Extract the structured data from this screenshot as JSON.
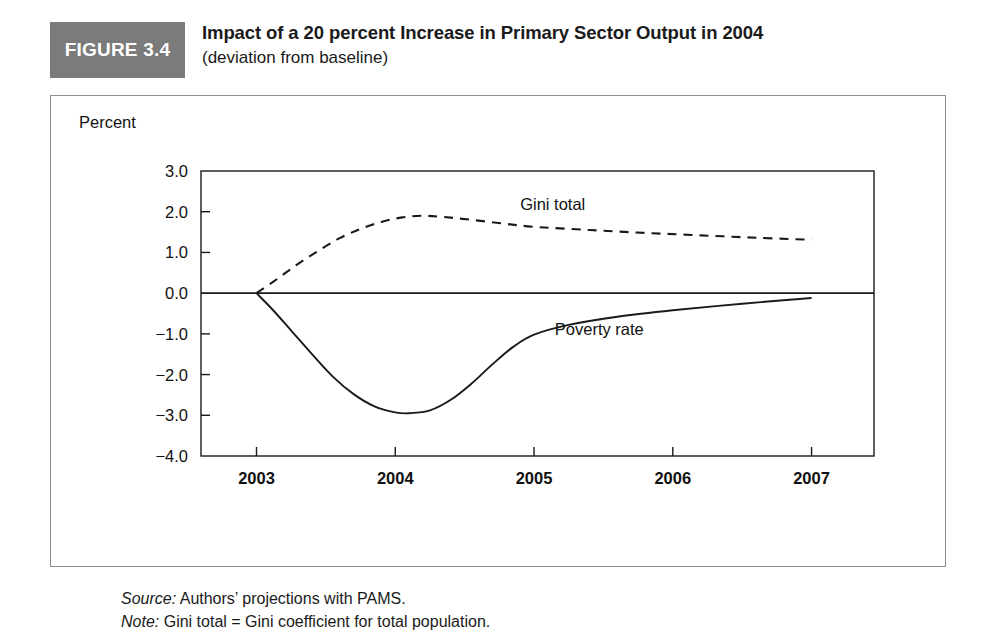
{
  "figure": {
    "tag": "FIGURE 3.4",
    "title": "Impact of a 20 percent Increase in Primary Sector Output in 2004",
    "subtitle": "(deviation from baseline)",
    "tag_bg_color": "#7b7b7b",
    "tag_text_color": "#ffffff",
    "frame_color": "#8d8d8d"
  },
  "footnotes": {
    "source_lead": "Source:",
    "source_text": " Authors’ projections with PAMS.",
    "note_lead": "Note:",
    "note_text": " Gini total = Gini coefficient for total population."
  },
  "chart_data": {
    "type": "line",
    "title": "Impact of a 20 percent Increase in Primary Sector Output in 2004",
    "subtitle": "(deviation from baseline)",
    "xlabel": "",
    "ylabel": "Percent",
    "unit_label": "Percent",
    "grid": false,
    "legend_position": "inline-labels",
    "x": [
      2003,
      2004,
      2005,
      2006,
      2007
    ],
    "xlim": [
      2002.6,
      2007.45
    ],
    "ylim": [
      -4.0,
      3.0
    ],
    "xticks": [
      "2003",
      "2004",
      "2005",
      "2006",
      "2007"
    ],
    "yticks": [
      "3.0",
      "2.0",
      "1.0",
      "0.0",
      "−1.0",
      "−2.0",
      "−3.0",
      "−4.0"
    ],
    "ytick_values": [
      3.0,
      2.0,
      1.0,
      0.0,
      -1.0,
      -2.0,
      -3.0,
      -4.0
    ],
    "zero_line": 0.0,
    "series": [
      {
        "name": "Gini total",
        "style": "dashed",
        "label_x": 2004.9,
        "label_y": 2.05,
        "points": [
          {
            "x": 2003.0,
            "y": 0.0
          },
          {
            "x": 2003.15,
            "y": 0.35
          },
          {
            "x": 2003.3,
            "y": 0.72
          },
          {
            "x": 2003.45,
            "y": 1.05
          },
          {
            "x": 2003.6,
            "y": 1.35
          },
          {
            "x": 2003.75,
            "y": 1.58
          },
          {
            "x": 2003.9,
            "y": 1.75
          },
          {
            "x": 2004.05,
            "y": 1.86
          },
          {
            "x": 2004.2,
            "y": 1.9
          },
          {
            "x": 2004.35,
            "y": 1.87
          },
          {
            "x": 2004.55,
            "y": 1.8
          },
          {
            "x": 2004.8,
            "y": 1.7
          },
          {
            "x": 2005.0,
            "y": 1.63
          },
          {
            "x": 2005.4,
            "y": 1.55
          },
          {
            "x": 2005.8,
            "y": 1.48
          },
          {
            "x": 2006.2,
            "y": 1.42
          },
          {
            "x": 2006.6,
            "y": 1.36
          },
          {
            "x": 2007.0,
            "y": 1.31
          }
        ]
      },
      {
        "name": "Poverty rate",
        "style": "solid",
        "label_x": 2005.15,
        "label_y": -1.03,
        "points": [
          {
            "x": 2003.0,
            "y": 0.0
          },
          {
            "x": 2003.12,
            "y": -0.42
          },
          {
            "x": 2003.25,
            "y": -0.92
          },
          {
            "x": 2003.4,
            "y": -1.5
          },
          {
            "x": 2003.55,
            "y": -2.05
          },
          {
            "x": 2003.7,
            "y": -2.48
          },
          {
            "x": 2003.85,
            "y": -2.78
          },
          {
            "x": 2004.0,
            "y": -2.93
          },
          {
            "x": 2004.1,
            "y": -2.95
          },
          {
            "x": 2004.25,
            "y": -2.88
          },
          {
            "x": 2004.4,
            "y": -2.62
          },
          {
            "x": 2004.55,
            "y": -2.22
          },
          {
            "x": 2004.7,
            "y": -1.75
          },
          {
            "x": 2004.85,
            "y": -1.32
          },
          {
            "x": 2005.0,
            "y": -1.02
          },
          {
            "x": 2005.25,
            "y": -0.78
          },
          {
            "x": 2005.6,
            "y": -0.58
          },
          {
            "x": 2006.0,
            "y": -0.42
          },
          {
            "x": 2006.5,
            "y": -0.26
          },
          {
            "x": 2007.0,
            "y": -0.12
          }
        ]
      }
    ]
  }
}
